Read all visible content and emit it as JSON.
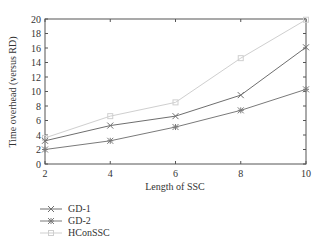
{
  "chart_data": {
    "type": "line",
    "title": "",
    "xlabel": "Length of SSC",
    "ylabel": "Time overhead (versus RD)",
    "x": [
      2,
      4,
      6,
      8,
      10
    ],
    "xticks": [
      "2",
      "4",
      "6",
      "8",
      "10"
    ],
    "yticks": [
      "0",
      "2",
      "4",
      "6",
      "8",
      "10",
      "12",
      "14",
      "16",
      "18",
      "20"
    ],
    "xlim": [
      2,
      10
    ],
    "ylim": [
      0,
      20
    ],
    "grid": false,
    "legend_position": "below-left",
    "series": [
      {
        "name": "GD-1",
        "marker": "x",
        "color": "#6e6e6e",
        "values": [
          3.2,
          5.3,
          6.6,
          9.5,
          16.1
        ]
      },
      {
        "name": "GD-2",
        "marker": "asterisk",
        "color": "#7a7a7a",
        "values": [
          2.0,
          3.2,
          5.1,
          7.4,
          10.3
        ]
      },
      {
        "name": "HConSSC",
        "marker": "square",
        "color": "#cfcfcf",
        "values": [
          3.6,
          6.6,
          8.5,
          14.6,
          19.9
        ]
      }
    ]
  },
  "legend": {
    "items": [
      "GD-1",
      "GD-2",
      "HConSSC"
    ]
  }
}
